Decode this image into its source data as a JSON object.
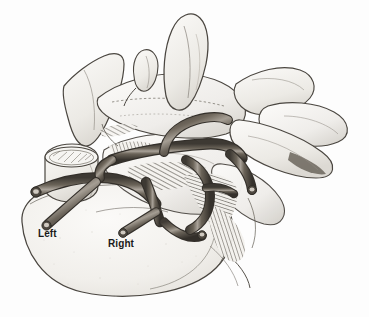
{
  "figure": {
    "kind": "anatomical-illustration",
    "background_color": "#fdfdfd",
    "ink_color": "#3b3b3b",
    "bone_fill": "#f2f1ee",
    "bone_shadow": "#d8d6d2",
    "vessel_dark": "#4a453f",
    "vessel_mid": "#6e675e",
    "vessel_light": "#b9b2a7",
    "hatch_color": "#5a554e",
    "label_color": "#1a1a1a",
    "plate_width": 369,
    "plate_height": 317
  },
  "annotations": [
    {
      "id": "left",
      "text": "Left",
      "x": 38,
      "y": 228
    },
    {
      "id": "right",
      "text": "Right",
      "x": 108,
      "y": 238
    }
  ],
  "labels": {
    "left": "Left",
    "right": "Right"
  }
}
